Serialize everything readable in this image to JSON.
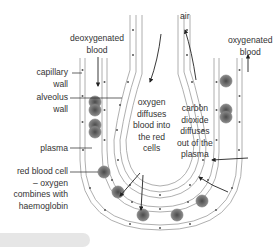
{
  "diagram": {
    "labels": {
      "air": "air",
      "deoxygenated_blood": [
        "deoxygenated",
        "blood"
      ],
      "oxygenated_blood": [
        "oxygenated",
        "blood"
      ],
      "capillary_wall": [
        "capillary",
        "wall"
      ],
      "alveolus_wall": [
        "alveolus",
        "wall"
      ],
      "plasma": "plasma",
      "red_blood_cell": [
        "red blood cell",
        "– oxygen",
        "combines with",
        "haemoglobin"
      ],
      "oxygen_diffuses": [
        "oxygen",
        "diffuses",
        "blood into",
        "the red",
        "cells"
      ],
      "carbon_dioxide_diffuses": [
        "carbon",
        "dioxide",
        "diffuses",
        "out of the",
        "plasma"
      ]
    },
    "colors": {
      "line": "#555555",
      "cell_fill": "#f2f2f2",
      "rbc_outer": "#777777",
      "rbc_inner": "#555555",
      "text": "#333333",
      "bar": "#e6e6e6"
    }
  }
}
